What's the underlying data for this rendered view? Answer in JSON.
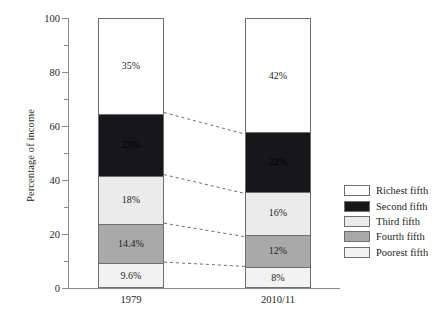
{
  "chart_data": {
    "type": "bar",
    "subtype": "stacked-bar-100",
    "title": "",
    "xlabel": "",
    "ylabel": "Percentage of income",
    "ylim": [
      0,
      100
    ],
    "grid": false,
    "legend_position": "right",
    "categories": [
      "1979",
      "2010/11"
    ],
    "tick_labels": [
      "0",
      "20",
      "40",
      "60",
      "80",
      "100"
    ],
    "tick_values": [
      0,
      20,
      40,
      60,
      80,
      100
    ],
    "minor_tick_values": [
      10,
      30,
      50,
      70,
      90
    ],
    "series": [
      {
        "name": "Richest fifth",
        "color": "#ffffff",
        "label_color": "#231f20",
        "values": [
          35,
          42
        ],
        "labels": [
          "35%",
          "42%"
        ]
      },
      {
        "name": "Second fifth",
        "color": "#17161a",
        "label_color": "#000000",
        "values": [
          23,
          22
        ],
        "labels": [
          "23%",
          "22%"
        ]
      },
      {
        "name": "Third fifth",
        "color": "#ebebeb",
        "label_color": "#231f20",
        "values": [
          18,
          16
        ],
        "labels": [
          "18%",
          "16%"
        ]
      },
      {
        "name": "Fourth fifth",
        "color": "#a9a9a9",
        "label_color": "#231f20",
        "values": [
          14.4,
          12
        ],
        "labels": [
          "14.4%",
          "12%"
        ]
      },
      {
        "name": "Poorest fifth",
        "color": "#f2f2f2",
        "label_color": "#231f20",
        "values": [
          9.6,
          8
        ],
        "labels": [
          "9.6%",
          "8%"
        ]
      }
    ],
    "connectors": [
      {
        "from_value": 65.0,
        "to_value": 57.0
      },
      {
        "from_value": 42.0,
        "to_value": 35.0
      },
      {
        "from_value": 24.0,
        "to_value": 19.0
      },
      {
        "from_value": 9.6,
        "to_value": 8.0
      }
    ],
    "annotations": [],
    "axis_color": "#8a8a8a",
    "bar_border_color": "#6e6e6e",
    "connector_color": "#6e6e6e"
  },
  "legend": {
    "items": [
      {
        "label": "Richest fifth"
      },
      {
        "label": "Second fifth"
      },
      {
        "label": "Third fifth"
      },
      {
        "label": "Fourth fifth"
      },
      {
        "label": "Poorest fifth"
      }
    ]
  }
}
